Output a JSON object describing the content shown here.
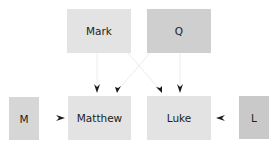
{
  "diagram": {
    "nodes": [
      {
        "id": "mark",
        "label": "Mark",
        "x": 67,
        "y": 9,
        "w": 64,
        "h": 44,
        "color": "#e3e3e3"
      },
      {
        "id": "q",
        "label": "Q",
        "x": 147,
        "y": 9,
        "w": 64,
        "h": 44,
        "color": "#cfcfcf"
      },
      {
        "id": "m",
        "label": "M",
        "x": 9,
        "y": 97,
        "w": 30,
        "h": 43,
        "color": "#d6d6d6"
      },
      {
        "id": "matthew",
        "label": "Matthew",
        "x": 68,
        "y": 96,
        "w": 63,
        "h": 44,
        "color": "#e3e3e3"
      },
      {
        "id": "luke",
        "label": "Luke",
        "x": 147,
        "y": 96,
        "w": 64,
        "h": 44,
        "color": "#e3e3e3"
      },
      {
        "id": "l",
        "label": "L",
        "x": 239,
        "y": 96,
        "w": 30,
        "h": 43,
        "color": "#c9c9c9"
      }
    ],
    "edges": [
      {
        "from": "Mark",
        "to": "Matthew"
      },
      {
        "from": "Q",
        "to": "Matthew"
      },
      {
        "from": "Mark",
        "to": "Luke"
      },
      {
        "from": "Q",
        "to": "Luke"
      },
      {
        "from": "M",
        "to": "Matthew"
      },
      {
        "from": "L",
        "to": "Luke"
      }
    ],
    "colors": {
      "line": "#ececec",
      "arrow": "#1a1a1a",
      "text": "#222222"
    }
  }
}
